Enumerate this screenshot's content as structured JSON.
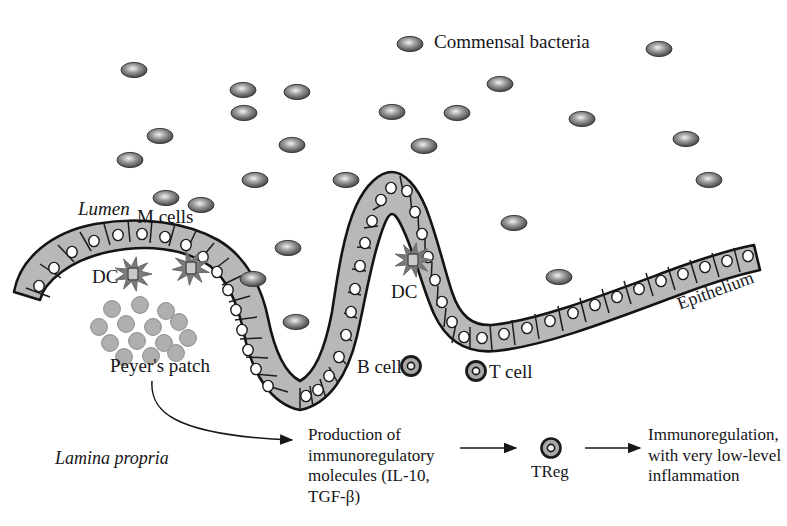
{
  "figure": {
    "background": "#ffffff",
    "ink": "#16161a",
    "cell_fill": "#b9b8b6",
    "cell_stroke": "#1a1a1a",
    "bacteria_color": "#5a5a5c",
    "lymphocyte_fill": "#a9a8a6"
  },
  "labels": {
    "commensal_bacteria": "Commensal bacteria",
    "lumen": "Lumen",
    "m_cells": "M cells",
    "dc_left": "DC",
    "dc_center": "DC",
    "peyers_patch": "Peyer's patch",
    "b_cell": "B cell",
    "t_cell": "T cell",
    "epithelium": "Epithelium",
    "lamina_propria": "Lamina propria",
    "treg": "TReg"
  },
  "pathway": {
    "step1": "Production of\nimmunoregulatory\nmolecules (IL-10,\nTGF-β)",
    "step2_label": "TReg",
    "step3": "Immunoregulation,\nwith very low-level\ninflammation"
  },
  "bacteria": [
    {
      "x": 410,
      "y": 44
    },
    {
      "x": 659,
      "y": 49
    },
    {
      "x": 134,
      "y": 70
    },
    {
      "x": 243,
      "y": 90
    },
    {
      "x": 297,
      "y": 92
    },
    {
      "x": 500,
      "y": 84
    },
    {
      "x": 244,
      "y": 113
    },
    {
      "x": 392,
      "y": 112
    },
    {
      "x": 457,
      "y": 113
    },
    {
      "x": 160,
      "y": 136
    },
    {
      "x": 582,
      "y": 119
    },
    {
      "x": 686,
      "y": 139
    },
    {
      "x": 130,
      "y": 160
    },
    {
      "x": 292,
      "y": 145
    },
    {
      "x": 424,
      "y": 146
    },
    {
      "x": 255,
      "y": 180
    },
    {
      "x": 166,
      "y": 198
    },
    {
      "x": 201,
      "y": 205
    },
    {
      "x": 346,
      "y": 180
    },
    {
      "x": 709,
      "y": 180
    },
    {
      "x": 514,
      "y": 223
    },
    {
      "x": 288,
      "y": 248
    },
    {
      "x": 253,
      "y": 279
    },
    {
      "x": 559,
      "y": 277
    },
    {
      "x": 296,
      "y": 322
    }
  ],
  "peyers_patch_cells": [
    {
      "x": 112,
      "y": 309
    },
    {
      "x": 140,
      "y": 305
    },
    {
      "x": 166,
      "y": 311
    },
    {
      "x": 99,
      "y": 327
    },
    {
      "x": 126,
      "y": 324
    },
    {
      "x": 153,
      "y": 327
    },
    {
      "x": 179,
      "y": 322
    },
    {
      "x": 110,
      "y": 343
    },
    {
      "x": 137,
      "y": 341
    },
    {
      "x": 164,
      "y": 343
    },
    {
      "x": 188,
      "y": 338
    },
    {
      "x": 124,
      "y": 357
    },
    {
      "x": 151,
      "y": 356
    },
    {
      "x": 176,
      "y": 353
    }
  ],
  "dendritic_cells": [
    {
      "x": 133,
      "y": 274
    },
    {
      "x": 191,
      "y": 268
    },
    {
      "x": 413,
      "y": 260
    }
  ],
  "legend_cells": [
    {
      "name": "b-cell",
      "x": 411,
      "y": 366
    },
    {
      "name": "t-cell",
      "x": 476,
      "y": 371
    }
  ]
}
